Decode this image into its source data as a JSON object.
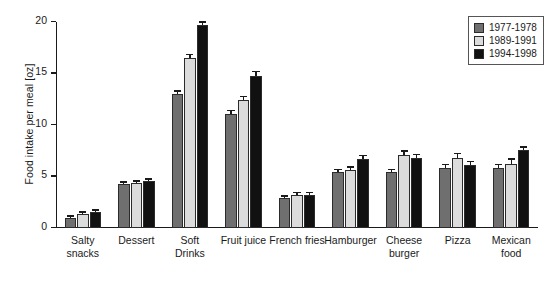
{
  "chart_data": {
    "type": "bar",
    "title": "",
    "xlabel": "",
    "ylabel": "Food intake per meal [oz]",
    "ylim": [
      0,
      20
    ],
    "yticks": [
      0,
      5,
      10,
      15,
      20
    ],
    "ytick_labels": [
      "0",
      "5",
      "10",
      "15",
      "20"
    ],
    "grid": false,
    "legend_position": "top-right",
    "categories": [
      "Salty\nsnacks",
      "Dessert",
      "Soft\nDrinks",
      "Fruit juice",
      "French fries",
      "Hamburger",
      "Cheese\nburger",
      "Pizza",
      "Mexican\nfood"
    ],
    "series": [
      {
        "name": "1977-1978",
        "color": "#6f6f6f",
        "values": [
          1.0,
          4.3,
          13.0,
          11.1,
          2.9,
          5.4,
          5.4,
          5.8,
          5.8
        ],
        "errors": [
          0.1,
          0.1,
          0.25,
          0.25,
          0.15,
          0.2,
          0.2,
          0.3,
          0.3
        ]
      },
      {
        "name": "1989-1991",
        "color": "#dcdcdc",
        "values": [
          1.4,
          4.4,
          16.5,
          12.4,
          3.2,
          5.6,
          7.1,
          6.8,
          6.2
        ],
        "errors": [
          0.1,
          0.1,
          0.3,
          0.3,
          0.2,
          0.25,
          0.3,
          0.35,
          0.45
        ]
      },
      {
        "name": "1994-1998",
        "color": "#111111",
        "values": [
          1.6,
          4.6,
          19.7,
          14.8,
          3.2,
          6.7,
          6.8,
          6.1,
          7.6
        ],
        "errors": [
          0.1,
          0.1,
          0.25,
          0.3,
          0.2,
          0.3,
          0.3,
          0.3,
          0.2
        ]
      }
    ]
  },
  "legend": {
    "items": [
      {
        "label": "1977-1978",
        "color": "#6f6f6f"
      },
      {
        "label": "1989-1991",
        "color": "#dcdcdc"
      },
      {
        "label": "1994-1998",
        "color": "#111111"
      }
    ]
  }
}
